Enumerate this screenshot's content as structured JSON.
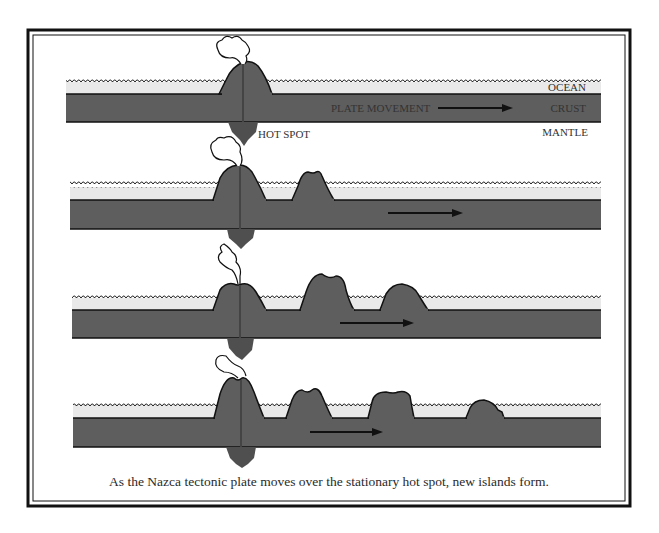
{
  "figure": {
    "caption": "As the Nazca tectonic plate moves over the stationary hot spot, new islands form.",
    "labels": {
      "ocean": "OCEAN",
      "crust": "CRUST",
      "mantle": "MANTLE",
      "hot_spot": "HOT SPOT",
      "plate_movement": "PLATE MOVEMENT"
    },
    "colors": {
      "crust": "#5e5e5e",
      "ocean": "#e9e9e9",
      "hot_spot": "#4f4f4f",
      "outline": "#111111",
      "frame": "#111111"
    },
    "stages": [
      {
        "name": "stage-1",
        "islands": 1,
        "description": "Active volcano over hot spot"
      },
      {
        "name": "stage-2",
        "islands": 2,
        "description": "First island carried east"
      },
      {
        "name": "stage-3",
        "islands": 3,
        "description": "Two older islands carried east"
      },
      {
        "name": "stage-4",
        "islands": 4,
        "description": "Three older islands, oldest eroding"
      }
    ]
  }
}
